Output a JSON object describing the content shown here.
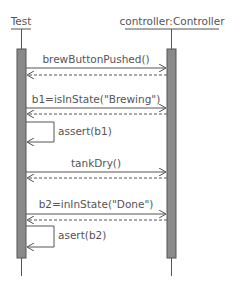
{
  "diagram": {
    "type": "sequence",
    "participants": [
      {
        "id": "test",
        "label": "Test"
      },
      {
        "id": "controller",
        "label": "controller:Controller"
      }
    ],
    "messages": [
      {
        "from": "test",
        "to": "controller",
        "label": "brewButtonPushed()",
        "kind": "call"
      },
      {
        "from": "controller",
        "to": "test",
        "label": "",
        "kind": "return"
      },
      {
        "from": "test",
        "to": "controller",
        "label": "b1=isInState(\"Brewing\")",
        "kind": "call"
      },
      {
        "from": "controller",
        "to": "test",
        "label": "",
        "kind": "return"
      },
      {
        "from": "test",
        "to": "test",
        "label": "assert(b1)",
        "kind": "self"
      },
      {
        "from": "test",
        "to": "controller",
        "label": "tankDry()",
        "kind": "call"
      },
      {
        "from": "controller",
        "to": "test",
        "label": "",
        "kind": "return"
      },
      {
        "from": "test",
        "to": "controller",
        "label": "b2=inInState(\"Done\")",
        "kind": "call"
      },
      {
        "from": "controller",
        "to": "test",
        "label": "",
        "kind": "return"
      },
      {
        "from": "test",
        "to": "test",
        "label": "asert(b2)",
        "kind": "self"
      }
    ],
    "colors": {
      "line": "#555555",
      "activation_fill": "#8a8a8a",
      "text": "#555555"
    }
  }
}
